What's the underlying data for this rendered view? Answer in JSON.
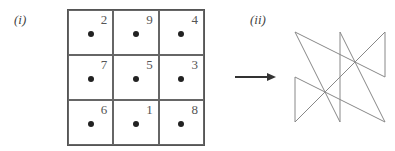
{
  "labels": {
    "part_i": "(i)",
    "part_ii": "(ii)"
  },
  "magic_square": {
    "rows": [
      [
        2,
        9,
        4
      ],
      [
        7,
        5,
        3
      ],
      [
        6,
        1,
        8
      ]
    ]
  },
  "path": {
    "order": [
      1,
      2,
      3,
      4,
      5,
      6,
      7,
      8,
      9
    ],
    "description": "Lines connecting cell centers in numeric order 1 through 9 and back to 1",
    "stroke_color": "#888888"
  },
  "arrow": {
    "color": "#333333"
  }
}
